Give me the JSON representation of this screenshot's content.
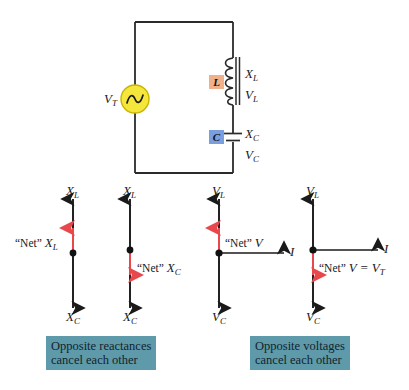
{
  "figure": {
    "type": "schematic-and-phasor-diagram",
    "background_color": "#ffffff"
  },
  "circuit": {
    "source": {
      "label": "V",
      "label_sub": "T",
      "icon": "ac-source-icon",
      "body_color": "#f5e63c",
      "outline_color": "#d9c400"
    },
    "inductor": {
      "box_label": "L",
      "box_color": "#f0b089",
      "annotations": [
        "X",
        "V"
      ],
      "annotation_subs": [
        "L",
        "L"
      ]
    },
    "capacitor": {
      "box_label": "C",
      "box_color": "#7a9fe0",
      "annotations": [
        "X",
        "V"
      ],
      "annotation_subs": [
        "C",
        "C"
      ]
    },
    "wire_color": "#2b2b2b"
  },
  "phasors": {
    "accent_color": "#e8474c",
    "axis_color": "#1a1a1a",
    "diagrams": [
      {
        "id": "net-xl",
        "top_label": "X",
        "top_label_sub": "L",
        "bottom_label": "X",
        "bottom_label_sub": "C",
        "net_text_prefix": "“Net” ",
        "net_text_var": "X",
        "net_text_sub": "L",
        "net_direction": "up",
        "has_current_axis": false
      },
      {
        "id": "net-xc",
        "top_label": "X",
        "top_label_sub": "L",
        "bottom_label": "X",
        "bottom_label_sub": "C",
        "net_text_prefix": "“Net” ",
        "net_text_var": "X",
        "net_text_sub": "C",
        "net_direction": "down",
        "has_current_axis": false
      },
      {
        "id": "net-v-inductive",
        "top_label": "V",
        "top_label_sub": "L",
        "bottom_label": "V",
        "bottom_label_sub": "C",
        "net_text_prefix": "“Net” ",
        "net_text_var": "V",
        "net_text_sub": "",
        "net_direction": "up",
        "has_current_axis": true,
        "current_label": "I"
      },
      {
        "id": "net-v-capacitive",
        "top_label": "V",
        "top_label_sub": "L",
        "bottom_label": "V",
        "bottom_label_sub": "C",
        "net_text_prefix": "“Net” ",
        "net_text_var": "V",
        "net_text_sub": "",
        "net_text_suffix": " = V",
        "net_text_suffix_sub": "T",
        "net_direction": "down",
        "has_current_axis": true,
        "current_label": "I"
      }
    ]
  },
  "captions": {
    "color": "#5f9aaa",
    "left": {
      "line1": "Opposite reactances",
      "line2": "cancel each other"
    },
    "right": {
      "line1": "Opposite voltages",
      "line2": "cancel each other"
    }
  }
}
